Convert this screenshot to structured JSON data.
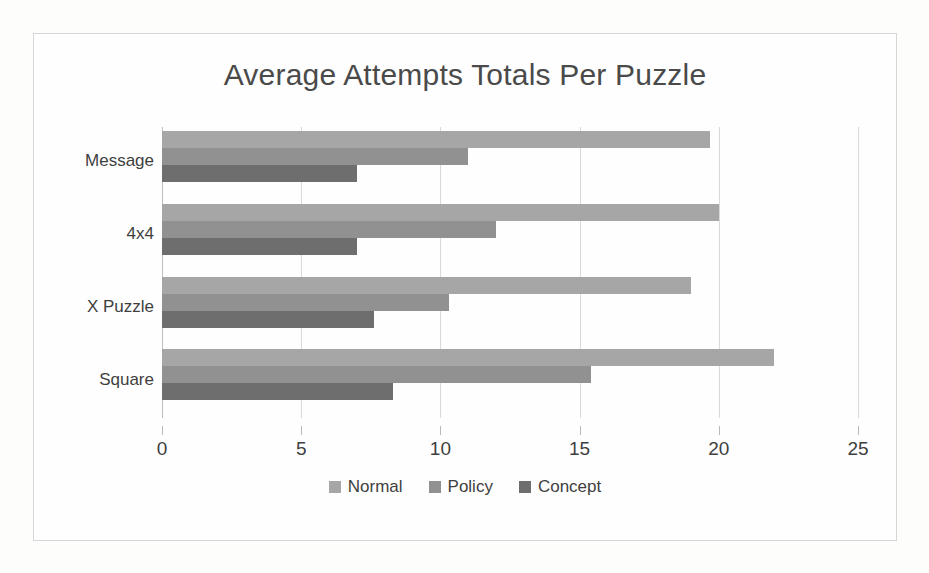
{
  "chart_data": {
    "type": "bar",
    "orientation": "horizontal",
    "title": "Average Attempts Totals Per Puzzle",
    "xlabel": "",
    "ylabel": "",
    "xlim": [
      0,
      25
    ],
    "xticks": [
      "0",
      "5",
      "10",
      "15",
      "20",
      "25"
    ],
    "xtick_values": [
      0,
      5,
      10,
      15,
      20,
      25
    ],
    "grid": true,
    "legend_position": "bottom",
    "categories": [
      "Message",
      "4x4",
      "X Puzzle",
      "Square"
    ],
    "series": [
      {
        "name": "Normal",
        "color": "#a6a6a6",
        "values": [
          19.7,
          20.0,
          19.0,
          22.0
        ]
      },
      {
        "name": "Policy",
        "color": "#919191",
        "values": [
          11.0,
          12.0,
          10.3,
          15.4
        ]
      },
      {
        "name": "Concept",
        "color": "#6e6e6e",
        "values": [
          7.0,
          7.0,
          7.6,
          8.3
        ]
      }
    ]
  },
  "chart": {
    "title": "Average Attempts Totals Per Puzzle"
  },
  "colors": {
    "normal": "#a6a6a6",
    "policy": "#919191",
    "concept": "#6e6e6e",
    "gridline": "#d9d9d9",
    "axis": "#bdbdbd",
    "text": "#3f3f3f",
    "title_text": "#4a4a4a",
    "frame_border": "#d6d6d6",
    "background": "#fefefe"
  }
}
